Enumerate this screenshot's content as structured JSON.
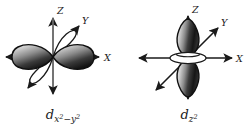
{
  "figure": {
    "background_color": "#ffffff",
    "line_color": "#1a1a1a",
    "lobe_dark_color": "#1c1c1c",
    "lobe_light_color": "#e8e8e8",
    "panels": [
      {
        "id": "dx2y2",
        "orbital_name": "d x2-y2",
        "caption_main": "d",
        "caption_sub_x": "x",
        "caption_sup_x": "2",
        "caption_minus": "−",
        "caption_sub_y": "y",
        "caption_sup_y": "2",
        "axes": [
          {
            "name": "z",
            "label": "Z"
          },
          {
            "name": "x",
            "label": "X"
          },
          {
            "name": "y",
            "label": "Y"
          }
        ],
        "lobes": [
          {
            "name": "lobe-x-positive",
            "style": "filled",
            "axis": "x",
            "direction": "positive"
          },
          {
            "name": "lobe-x-negative",
            "style": "filled",
            "axis": "x",
            "direction": "negative"
          },
          {
            "name": "lobe-y-positive",
            "style": "outline",
            "axis": "y",
            "direction": "positive"
          },
          {
            "name": "lobe-y-negative",
            "style": "outline",
            "axis": "y",
            "direction": "negative"
          }
        ],
        "torus": null
      },
      {
        "id": "dz2",
        "orbital_name": "d z2",
        "caption_main": "d",
        "caption_sub_z": "z",
        "caption_sup_z": "2",
        "axes": [
          {
            "name": "z",
            "label": "Z"
          },
          {
            "name": "x",
            "label": "X"
          },
          {
            "name": "y",
            "label": "Y"
          }
        ],
        "lobes": [
          {
            "name": "lobe-z-positive",
            "style": "filled",
            "axis": "z",
            "direction": "positive"
          },
          {
            "name": "lobe-z-negative",
            "style": "filled",
            "axis": "z",
            "direction": "negative"
          }
        ],
        "torus": {
          "name": "torus-ring",
          "style": "outline",
          "plane": "xy"
        }
      }
    ]
  }
}
